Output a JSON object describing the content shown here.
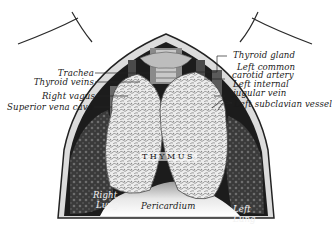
{
  "figure": {
    "colors": {
      "background": "#ffffff",
      "ink": "#1a1a1a",
      "cavity_dark": "#1c1c1c",
      "gland_light": "#e9e9e9",
      "pericardium": "#f4f4f4"
    }
  },
  "labels": {
    "left": [
      {
        "text": "Trachea"
      },
      {
        "text": "Thyroid veins"
      },
      {
        "text": "Right vagus"
      },
      {
        "text": "Superior vena cava"
      }
    ],
    "right": [
      {
        "text": "Thyroid gland"
      },
      {
        "text": "Left common"
      },
      {
        "text": "carotid artery"
      },
      {
        "text": "Left internal"
      },
      {
        "text": "jugular vein"
      },
      {
        "text": "Left subclavian vessel"
      }
    ],
    "center": {
      "thymus": "THYMUS",
      "pericardium": "Pericardium"
    },
    "lungs": {
      "right_1": "Right",
      "right_2": "Lung",
      "left_1": "Left",
      "left_2": "Lung"
    }
  }
}
